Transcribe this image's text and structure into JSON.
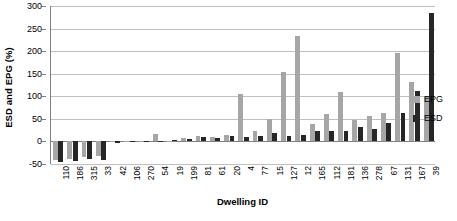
{
  "chart_data": {
    "type": "bar",
    "title": "",
    "xlabel": "Dwelling ID",
    "ylabel": "ESD and EPG (%)",
    "ylim": [
      -50,
      300
    ],
    "yticks": [
      300,
      250,
      200,
      150,
      100,
      50,
      0,
      -50
    ],
    "ytick_labels": [
      "300",
      "250",
      "200",
      "150",
      "100",
      "50",
      "0",
      "-50"
    ],
    "grid": true,
    "legend_position": "right",
    "categories": [
      "110",
      "186",
      "315",
      "33",
      "42",
      "106",
      "270",
      "54",
      "19",
      "199",
      "81",
      "61",
      "20",
      "4",
      "77",
      "15",
      "127",
      "12",
      "165",
      "112",
      "181",
      "136",
      "278",
      "67",
      "131",
      "167",
      "39"
    ],
    "series": [
      {
        "name": "EPG",
        "color": "#a6a6a6",
        "values": [
          -42,
          -40,
          -34,
          -33,
          -2,
          -1,
          0,
          17,
          2,
          8,
          13,
          10,
          15,
          104,
          22,
          49,
          154,
          233,
          39,
          60,
          109,
          48,
          56,
          62,
          196,
          131,
          100
        ]
      },
      {
        "name": "ESD",
        "color": "#262626",
        "values": [
          -46,
          -44,
          -39,
          -41,
          -3,
          -2,
          -1,
          2,
          3,
          6,
          9,
          8,
          11,
          9,
          13,
          19,
          13,
          15,
          24,
          23,
          23,
          33,
          27,
          40,
          64,
          111,
          285
        ]
      }
    ]
  },
  "legend": {
    "items": [
      {
        "label": "EPG",
        "color": "#a6a6a6"
      },
      {
        "label": "ESD",
        "color": "#262626"
      }
    ]
  }
}
